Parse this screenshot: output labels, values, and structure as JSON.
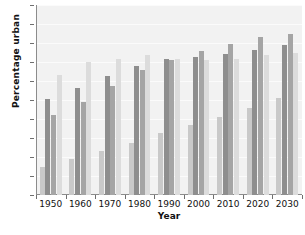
{
  "chart_data": {
    "type": "bar",
    "title": "",
    "xlabel": "Year",
    "ylabel": "Percentage urban",
    "categories": [
      "1950",
      "1960",
      "1970",
      "1980",
      "1990",
      "2000",
      "2010",
      "2020",
      "2030"
    ],
    "ylim": [
      0,
      100
    ],
    "yticks": [
      0,
      10,
      20,
      30,
      40,
      50,
      60,
      70,
      80,
      90,
      100
    ],
    "grid": true,
    "legend_position": "below-clipped",
    "series": [
      {
        "name": "series-1",
        "color": "#c9c9c9",
        "values": [
          15,
          19,
          23,
          27.5,
          32.5,
          37,
          41,
          46,
          51
        ]
      },
      {
        "name": "series-2",
        "color": "#8e8e8e",
        "values": [
          50.5,
          56.5,
          62.5,
          68,
          71.5,
          72.5,
          74,
          76.5,
          79
        ]
      },
      {
        "name": "series-3",
        "color": "#a5a5a5",
        "values": [
          42,
          49,
          57.5,
          66,
          71,
          76,
          79.5,
          83,
          85
        ]
      },
      {
        "name": "series-4",
        "color": "#dcdcdc",
        "values": [
          63,
          70,
          71.5,
          73.5,
          71.5,
          71,
          71.5,
          73.5,
          75
        ]
      }
    ]
  },
  "axes": {
    "ylabel": "Percentage urban",
    "xlabel": "Year"
  },
  "legend_strip": {
    "text": ""
  }
}
